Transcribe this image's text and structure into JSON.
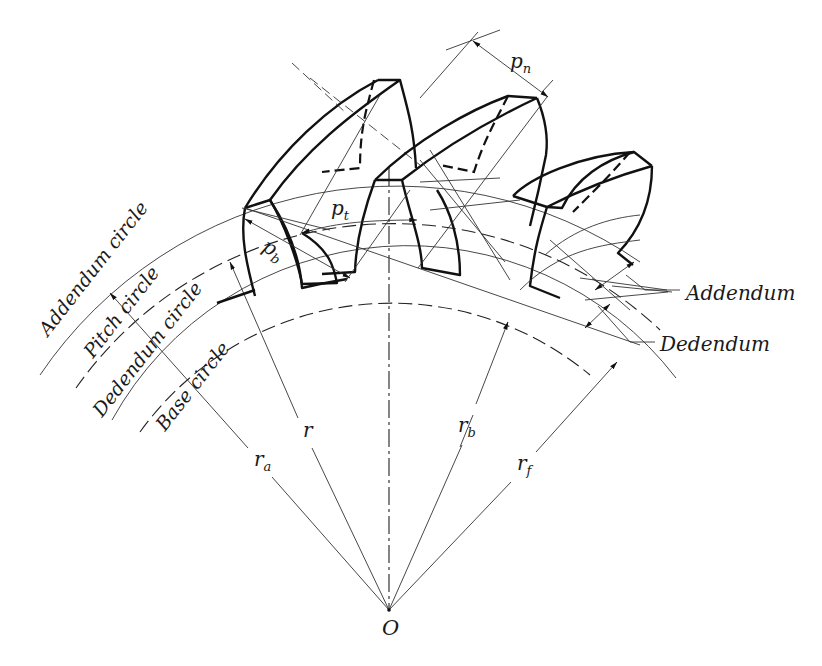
{
  "figure": {
    "circles": {
      "addendum": "Addendum circle",
      "pitch": "Pitch circle",
      "dedendum": "Dedendum circle",
      "base": "Base circle"
    },
    "callouts": {
      "addendum": "Addendum",
      "dedendum": "Dedendum"
    },
    "symbols": {
      "pn": {
        "base": "p",
        "sub": "n"
      },
      "pt": {
        "base": "p",
        "sub": "t"
      },
      "pb": {
        "base": "p",
        "sub": "b"
      },
      "ra": {
        "base": "r",
        "sub": "a"
      },
      "r": {
        "base": "r",
        "sub": ""
      },
      "rb": {
        "base": "r",
        "sub": "b"
      },
      "rf": {
        "base": "r",
        "sub": "f"
      },
      "center": "O"
    },
    "colors": {
      "ink": "#111111",
      "background": "#ffffff"
    }
  }
}
